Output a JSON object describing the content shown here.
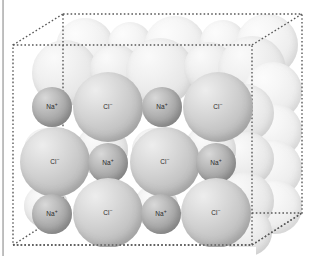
{
  "figure": {
    "name": "sodium-chloride-crystal-lattice",
    "cube": {
      "style": "dashed",
      "color": "#5a5a5a",
      "front_face": {
        "left": 13,
        "top": 45,
        "right": 252,
        "bottom": 245
      },
      "back_face": {
        "left": 63,
        "top": 14,
        "right": 302,
        "bottom": 213
      }
    },
    "colors": {
      "cation": "#b0b0b0",
      "anion": "#cccccc",
      "ghost": "#ededed",
      "label": "#2b2b2b",
      "outline": "#5a5a5a",
      "page_rule": "#a8a8a8",
      "background": "#ffffff"
    },
    "ion_labels": {
      "cation": "Na",
      "cation_charge": "+",
      "anion": "Cl",
      "anion_charge": "−"
    },
    "front_layer": {
      "rows": [
        {
          "row": 1,
          "ions": [
            {
              "species": "cation",
              "label": "Na",
              "charge": "+",
              "cx": 52,
              "cy": 107,
              "r": 20
            },
            {
              "species": "anion",
              "label": "Cl",
              "charge": "−",
              "cx": 108,
              "cy": 107,
              "r": 35
            },
            {
              "species": "cation",
              "label": "Na",
              "charge": "+",
              "cx": 162,
              "cy": 107,
              "r": 20
            },
            {
              "species": "anion",
              "label": "Cl",
              "charge": "−",
              "cx": 218,
              "cy": 107,
              "r": 35
            }
          ]
        },
        {
          "row": 2,
          "ions": [
            {
              "species": "anion",
              "label": "Cl",
              "charge": "−",
              "cx": 55,
              "cy": 162,
              "r": 35
            },
            {
              "species": "cation",
              "label": "Na",
              "charge": "+",
              "cx": 108,
              "cy": 163,
              "r": 20
            },
            {
              "species": "anion",
              "label": "Cl",
              "charge": "−",
              "cx": 165,
              "cy": 162,
              "r": 35
            },
            {
              "species": "cation",
              "label": "Na",
              "charge": "+",
              "cx": 216,
              "cy": 163,
              "r": 20
            }
          ]
        },
        {
          "row": 3,
          "ions": [
            {
              "species": "cation",
              "label": "Na",
              "charge": "+",
              "cx": 52,
              "cy": 214,
              "r": 20
            },
            {
              "species": "anion",
              "label": "Cl",
              "charge": "−",
              "cx": 108,
              "cy": 213,
              "r": 35
            },
            {
              "species": "cation",
              "label": "Na",
              "charge": "+",
              "cx": 161,
              "cy": 214,
              "r": 20
            },
            {
              "species": "anion",
              "label": "Cl",
              "charge": "−",
              "cx": 216,
              "cy": 213,
              "r": 35
            }
          ]
        }
      ]
    }
  }
}
